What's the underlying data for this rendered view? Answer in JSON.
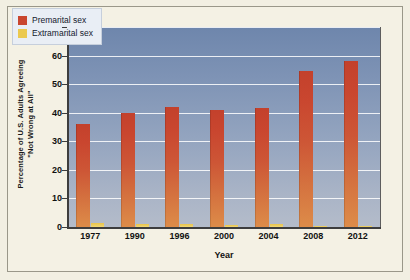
{
  "chart_data": {
    "type": "bar",
    "title": "",
    "xlabel": "Year",
    "ylabel_line1": "Percentage of U.S. Adults Agreeing",
    "ylabel_line2": "\"Not Wrong at All\"",
    "categories": [
      "1977",
      "1990",
      "1996",
      "2000",
      "2004",
      "2008",
      "2012"
    ],
    "series": [
      {
        "name": "Premarital sex",
        "color": "#c9462f",
        "values": [
          36,
          40,
          42,
          41,
          41.5,
          54.5,
          58
        ]
      },
      {
        "name": "Extramarital sex",
        "color": "#ebc94f",
        "values": [
          1.5,
          1,
          1,
          0.8,
          1,
          0.5,
          0.5
        ]
      }
    ],
    "ylim": [
      0,
      70
    ],
    "yticks": [
      0,
      10,
      20,
      30,
      40,
      50,
      60,
      70
    ],
    "ytick_labels": [
      "0",
      "10",
      "20",
      "30",
      "40",
      "50",
      "60",
      "70"
    ],
    "grid": true,
    "legend_position": "top-left"
  },
  "legend": {
    "items": [
      {
        "label": "Premarital sex",
        "color": "#c9462f"
      },
      {
        "label": "Extramarital sex",
        "color": "#ebc94f"
      }
    ]
  },
  "colors": {
    "figure_background": "#f2efe2",
    "plot_top": "#6e86ac",
    "plot_bottom": "#b4bcca",
    "gridline": "#ffffff",
    "axis": "#3d3d3d",
    "premarital": "#c9462f",
    "extramarital": "#ebc94f"
  }
}
